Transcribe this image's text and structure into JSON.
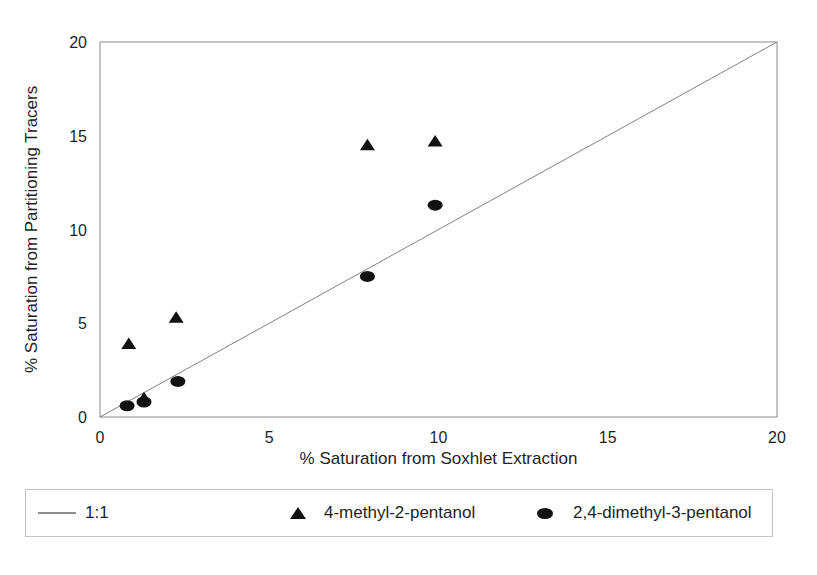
{
  "chart_data": {
    "type": "scatter",
    "title": "",
    "xlabel": "% Saturation from Soxhlet Extraction",
    "ylabel": "% Saturation from Partitioning Tracers",
    "xlim": [
      0,
      20
    ],
    "ylim": [
      0,
      20
    ],
    "xticks": [
      0,
      5,
      10,
      15,
      20
    ],
    "yticks": [
      0,
      5,
      10,
      15,
      20
    ],
    "grid": false,
    "legend_position": "bottom",
    "reference_line": {
      "label": "1:1",
      "from": [
        0,
        0
      ],
      "to": [
        20,
        20
      ]
    },
    "series": [
      {
        "name": "4-methyl-2-pentanol",
        "marker": "triangle",
        "color": "#121212",
        "points": [
          [
            0.85,
            3.9
          ],
          [
            1.3,
            1.0
          ],
          [
            2.25,
            5.3
          ],
          [
            7.9,
            14.5
          ],
          [
            9.9,
            14.7
          ]
        ]
      },
      {
        "name": "2,4-dimethyl-3-pentanol",
        "marker": "circle",
        "color": "#121212",
        "points": [
          [
            0.8,
            0.6
          ],
          [
            1.3,
            0.8
          ],
          [
            2.3,
            1.9
          ],
          [
            7.9,
            7.5
          ],
          [
            9.9,
            11.3
          ]
        ]
      }
    ]
  },
  "legend": {
    "line_label": "1:1",
    "triangle_label": "4-methyl-2-pentanol",
    "circle_label": "2,4-dimethyl-3-pentanol"
  },
  "colors": {
    "marker": "#121212",
    "reference_line": "#808080",
    "frame": "#8a8a8a",
    "text": "#1f1f1f",
    "legend_border": "#c4c4c4"
  }
}
